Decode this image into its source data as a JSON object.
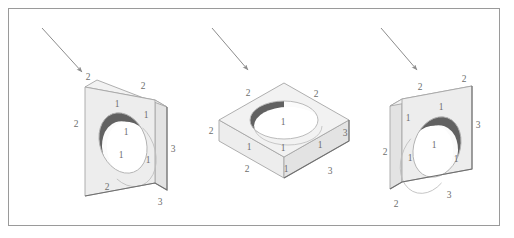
{
  "figure": {
    "background_color": "#ffffff",
    "frame": {
      "stroke_color": "#9a9a9a",
      "x": 8,
      "y": 8,
      "width": 492,
      "height": 218
    },
    "style": {
      "edge_color": "#a6a6a6",
      "heavy_edge_color": "#6f6f6f",
      "face_top_color": "#f2f2f2",
      "face_front_color": "#ededed",
      "face_side_color": "#e3e3e3",
      "hole_fill_color": "#fbfbfb",
      "hole_shadow_color": "#595959",
      "label_color": "#6d6d6d",
      "arrow_color": "#8c8c8c"
    },
    "objects": [
      {
        "id": "object-1",
        "name": "block-upright-hole-left",
        "orientation": "upright slab, hole on front face, inner wall shaded upper-left",
        "arrow": {
          "name": "view-direction-arrow-1",
          "from_x": 42,
          "from_y": 28,
          "to_x": 84,
          "to_y": 74
        },
        "labels": [
          {
            "text": "2",
            "x": 88,
            "y": 80
          },
          {
            "text": "2",
            "x": 143,
            "y": 89
          },
          {
            "text": "1",
            "x": 117,
            "y": 107
          },
          {
            "text": "1",
            "x": 146,
            "y": 118
          },
          {
            "text": "2",
            "x": 76,
            "y": 127
          },
          {
            "text": "1",
            "x": 126,
            "y": 135
          },
          {
            "text": "1",
            "x": 121,
            "y": 158
          },
          {
            "text": "1",
            "x": 148,
            "y": 163
          },
          {
            "text": "3",
            "x": 173,
            "y": 152
          },
          {
            "text": "2",
            "x": 107,
            "y": 190
          },
          {
            "text": "3",
            "x": 160,
            "y": 205
          }
        ]
      },
      {
        "id": "object-2",
        "name": "block-flat-hole-top",
        "orientation": "flat slab lying down, hole through top face, inner wall shaded left",
        "arrow": {
          "name": "view-direction-arrow-2",
          "from_x": 212,
          "from_y": 28,
          "to_x": 250,
          "to_y": 72
        },
        "labels": [
          {
            "text": "2",
            "x": 248,
            "y": 96
          },
          {
            "text": "2",
            "x": 316,
            "y": 97
          },
          {
            "text": "1",
            "x": 283,
            "y": 125
          },
          {
            "text": "2",
            "x": 211,
            "y": 134
          },
          {
            "text": "1",
            "x": 249,
            "y": 150
          },
          {
            "text": "1",
            "x": 283,
            "y": 151
          },
          {
            "text": "1",
            "x": 320,
            "y": 148
          },
          {
            "text": "2",
            "x": 247,
            "y": 172
          },
          {
            "text": "1",
            "x": 286,
            "y": 172
          },
          {
            "text": "3",
            "x": 345,
            "y": 136
          },
          {
            "text": "3",
            "x": 330,
            "y": 174
          }
        ]
      },
      {
        "id": "object-3",
        "name": "block-upright-hole-right",
        "orientation": "upright slab, hole on front face, inner wall shaded upper-right",
        "arrow": {
          "name": "view-direction-arrow-3",
          "from_x": 381,
          "from_y": 28,
          "to_x": 419,
          "to_y": 72
        },
        "labels": [
          {
            "text": "2",
            "x": 420,
            "y": 90
          },
          {
            "text": "2",
            "x": 464,
            "y": 82
          },
          {
            "text": "1",
            "x": 441,
            "y": 110
          },
          {
            "text": "1",
            "x": 408,
            "y": 121
          },
          {
            "text": "3",
            "x": 478,
            "y": 128
          },
          {
            "text": "2",
            "x": 385,
            "y": 155
          },
          {
            "text": "1",
            "x": 410,
            "y": 161
          },
          {
            "text": "1",
            "x": 434,
            "y": 148
          },
          {
            "text": "1",
            "x": 456,
            "y": 162
          },
          {
            "text": "3",
            "x": 449,
            "y": 198
          },
          {
            "text": "2",
            "x": 396,
            "y": 207
          }
        ]
      }
    ]
  }
}
